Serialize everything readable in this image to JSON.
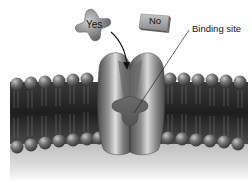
{
  "diagram": {
    "labels": {
      "yes": "Yes",
      "no": "No",
      "binding_site": "Binding site"
    },
    "elements": {
      "yes_ligand": "cross-shaped molecule that fits binding site",
      "no_ligand": "rectangular molecule that does not fit",
      "receptor": "membrane protein with cross-shaped binding site",
      "membrane": "phospholipid bilayer"
    },
    "colors": {
      "background": "#ffffff",
      "membrane_core": "#2a2a2a",
      "heads": "#6e6e6e",
      "protein": "#7a7a7a",
      "ligand": "#8a8a8a",
      "text": "#111111"
    }
  }
}
